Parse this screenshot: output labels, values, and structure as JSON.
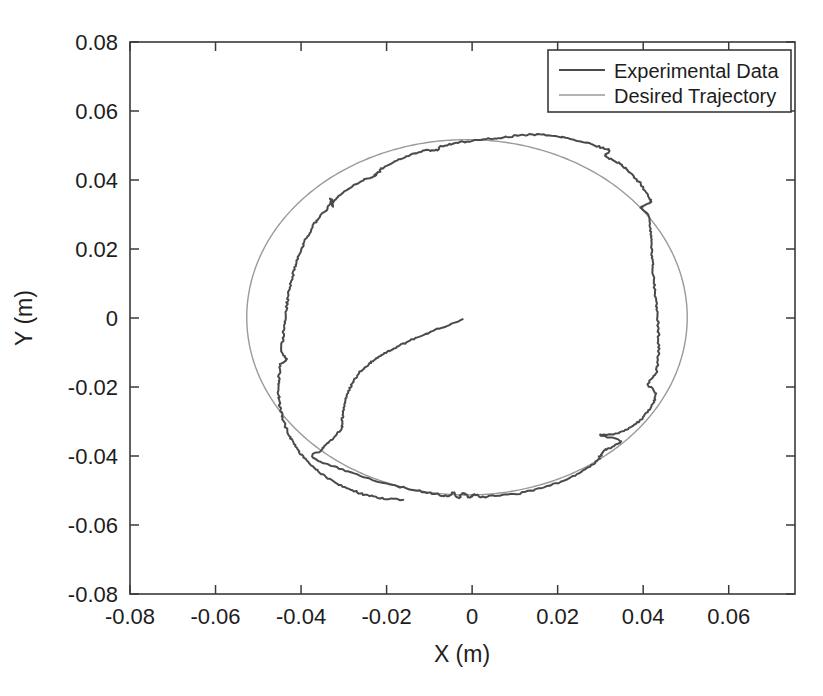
{
  "chart_data": {
    "type": "line",
    "title": "",
    "xlabel": "X (m)",
    "ylabel": "Y (m)",
    "xlim": [
      -0.08,
      0.0755
    ],
    "ylim": [
      -0.08,
      0.08
    ],
    "xticks": [
      -0.08,
      -0.06,
      -0.04,
      -0.02,
      0,
      0.02,
      0.04,
      0.06
    ],
    "yticks": [
      0.08,
      0.06,
      0.04,
      0.02,
      0,
      -0.02,
      -0.04,
      -0.06,
      -0.08
    ],
    "xticklabels": [
      "-0.08",
      "-0.06",
      "-0.04",
      "-0.02",
      "0",
      "0.02",
      "0.04",
      "0.06"
    ],
    "yticklabels": [
      "0.08",
      "0.06",
      "0.04",
      "0.02",
      "0",
      "-0.02",
      "-0.04",
      "-0.06",
      "-0.08"
    ],
    "grid": false,
    "box": true,
    "legend_position": "top-right",
    "colors": {
      "experimental": "#4a4a4a",
      "desired": "#9a9a9a",
      "axis": "#3a3a3a",
      "background": "#ffffff"
    },
    "series": [
      {
        "name": "Experimental Data",
        "color": "#4a4a4a",
        "description": "Noisy measured end-effector path: begins near the origin, spirals outward down-left, then tracks one full counter-clockwise revolution around the commanded circle.",
        "points": [
          [
            -0.0023,
            -0.0005
          ],
          [
            -0.006,
            -0.0023
          ],
          [
            -0.0095,
            -0.004
          ],
          [
            -0.0128,
            -0.0057
          ],
          [
            -0.0158,
            -0.0073
          ],
          [
            -0.0186,
            -0.009
          ],
          [
            -0.0211,
            -0.0107
          ],
          [
            -0.0232,
            -0.0124
          ],
          [
            -0.025,
            -0.0142
          ],
          [
            -0.0264,
            -0.016
          ],
          [
            -0.0276,
            -0.018
          ],
          [
            -0.0285,
            -0.0201
          ],
          [
            -0.0292,
            -0.0223
          ],
          [
            -0.0297,
            -0.0246
          ],
          [
            -0.0301,
            -0.027
          ],
          [
            -0.0304,
            -0.0294
          ],
          [
            -0.0306,
            -0.0318
          ],
          [
            -0.032,
            -0.0341
          ],
          [
            -0.0336,
            -0.0361
          ],
          [
            -0.0355,
            -0.0384
          ],
          [
            -0.0375,
            -0.0404
          ],
          [
            -0.0331,
            -0.0427
          ],
          [
            -0.0282,
            -0.0449
          ],
          [
            -0.0231,
            -0.047
          ],
          [
            -0.0178,
            -0.0487
          ],
          [
            -0.0124,
            -0.0501
          ],
          [
            -0.0082,
            -0.0511
          ],
          [
            -0.0055,
            -0.0516
          ],
          [
            -0.0043,
            -0.0505
          ],
          [
            -0.0032,
            -0.0521
          ],
          [
            -0.002,
            -0.0507
          ],
          [
            -0.0008,
            -0.052
          ],
          [
            0.0006,
            -0.0511
          ],
          [
            0.0021,
            -0.0519
          ],
          [
            0.006,
            -0.0514
          ],
          [
            0.0104,
            -0.0509
          ],
          [
            0.0148,
            -0.0497
          ],
          [
            0.019,
            -0.0482
          ],
          [
            0.0229,
            -0.0463
          ],
          [
            0.0264,
            -0.044
          ],
          [
            0.029,
            -0.0417
          ],
          [
            0.0301,
            -0.0398
          ],
          [
            0.0312,
            -0.0383
          ],
          [
            0.033,
            -0.0372
          ],
          [
            0.0348,
            -0.0356
          ],
          [
            0.03,
            -0.034
          ],
          [
            0.0335,
            -0.0336
          ],
          [
            0.0367,
            -0.0318
          ],
          [
            0.0392,
            -0.0297
          ],
          [
            0.0411,
            -0.0272
          ],
          [
            0.0424,
            -0.0245
          ],
          [
            0.0428,
            -0.0216
          ],
          [
            0.0412,
            -0.019
          ],
          [
            0.043,
            -0.016
          ],
          [
            0.0434,
            -0.0127
          ],
          [
            0.0436,
            -0.0093
          ],
          [
            0.0436,
            -0.0058
          ],
          [
            0.0435,
            -0.0022
          ],
          [
            0.0433,
            0.0014
          ],
          [
            0.043,
            0.005
          ],
          [
            0.0427,
            0.0086
          ],
          [
            0.0424,
            0.0122
          ],
          [
            0.0422,
            0.0158
          ],
          [
            0.042,
            0.0193
          ],
          [
            0.0418,
            0.0228
          ],
          [
            0.0416,
            0.0263
          ],
          [
            0.0413,
            0.0297
          ],
          [
            0.0395,
            0.0322
          ],
          [
            0.0418,
            0.0335
          ],
          [
            0.0409,
            0.036
          ],
          [
            0.0396,
            0.0385
          ],
          [
            0.038,
            0.0409
          ],
          [
            0.0361,
            0.0431
          ],
          [
            0.0339,
            0.0452
          ],
          [
            0.0313,
            0.047
          ],
          [
            0.032,
            0.0487
          ],
          [
            0.0292,
            0.0498
          ],
          [
            0.026,
            0.051
          ],
          [
            0.0227,
            0.0521
          ],
          [
            0.0192,
            0.0528
          ],
          [
            0.0157,
            0.0531
          ],
          [
            0.0122,
            0.053
          ],
          [
            0.0087,
            0.0526
          ],
          [
            0.0052,
            0.0521
          ],
          [
            0.0017,
            0.0516
          ],
          [
            -0.0018,
            0.0511
          ],
          [
            -0.0053,
            0.0503
          ],
          [
            -0.0075,
            0.0497
          ],
          [
            -0.0082,
            0.0486
          ],
          [
            -0.011,
            0.0485
          ],
          [
            -0.0144,
            0.0472
          ],
          [
            -0.0176,
            0.0456
          ],
          [
            -0.0206,
            0.0438
          ],
          [
            -0.022,
            0.0421
          ],
          [
            -0.023,
            0.041
          ],
          [
            -0.0248,
            0.0404
          ],
          [
            -0.0276,
            0.0385
          ],
          [
            -0.0301,
            0.0364
          ],
          [
            -0.0322,
            0.0341
          ],
          [
            -0.0327,
            0.0324
          ],
          [
            -0.033,
            0.0345
          ],
          [
            -0.0337,
            0.032
          ],
          [
            -0.0355,
            0.0296
          ],
          [
            -0.037,
            0.027
          ],
          [
            -0.0383,
            0.0242
          ],
          [
            -0.0394,
            0.0213
          ],
          [
            -0.0404,
            0.0184
          ],
          [
            -0.0412,
            0.0154
          ],
          [
            -0.0419,
            0.0124
          ],
          [
            -0.0425,
            0.0093
          ],
          [
            -0.043,
            0.0062
          ],
          [
            -0.0434,
            0.003
          ],
          [
            -0.0437,
            -0.0002
          ],
          [
            -0.044,
            -0.0034
          ],
          [
            -0.0443,
            -0.0066
          ],
          [
            -0.0447,
            -0.0098
          ],
          [
            -0.0434,
            -0.012
          ],
          [
            -0.0448,
            -0.0135
          ],
          [
            -0.0451,
            -0.0165
          ],
          [
            -0.0453,
            -0.0196
          ],
          [
            -0.0452,
            -0.0227
          ],
          [
            -0.0449,
            -0.0257
          ],
          [
            -0.0443,
            -0.0288
          ],
          [
            -0.0435,
            -0.0318
          ],
          [
            -0.0424,
            -0.0348
          ],
          [
            -0.041,
            -0.0377
          ],
          [
            -0.0393,
            -0.0404
          ],
          [
            -0.0373,
            -0.043
          ],
          [
            -0.035,
            -0.0454
          ],
          [
            -0.0323,
            -0.0475
          ],
          [
            -0.0294,
            -0.0493
          ],
          [
            -0.0263,
            -0.0507
          ],
          [
            -0.023,
            -0.0518
          ],
          [
            -0.0196,
            -0.0524
          ],
          [
            -0.0161,
            -0.0527
          ]
        ]
      },
      {
        "name": "Desired Trajectory",
        "color": "#9a9a9a",
        "description": "Commanded circular reference path, radius approximately 0.05 m centred slightly left of and below the origin.",
        "center": [
          -0.0012,
          0.0002
        ],
        "radius": 0.0515,
        "shape": "circle"
      }
    ]
  },
  "legend": {
    "entries": [
      {
        "label": "Experimental Data",
        "color": "#4a4a4a",
        "width": 2.0
      },
      {
        "label": "Desired Trajectory",
        "color": "#9a9a9a",
        "width": 1.4
      }
    ]
  },
  "axes": {
    "x_title": "X (m)",
    "y_title": "Y (m)"
  }
}
